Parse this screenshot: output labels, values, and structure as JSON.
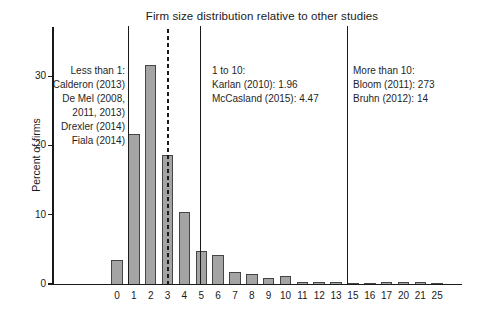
{
  "chart_data": {
    "type": "bar",
    "title": "Firm size distribution relative to other studies",
    "xlabel": "",
    "ylabel": "Percent of firms",
    "categories": [
      "0",
      "1",
      "2",
      "3",
      "4",
      "5",
      "6",
      "7",
      "8",
      "9",
      "10",
      "11",
      "12",
      "13",
      "15",
      "16",
      "17",
      "20",
      "21",
      "25"
    ],
    "values": [
      3.5,
      21.7,
      31.6,
      18.6,
      10.4,
      4.7,
      4.2,
      1.8,
      1.5,
      0.8,
      1.2,
      0.35,
      0.25,
      0.3,
      0.2,
      0.2,
      0.25,
      0.3,
      0.25,
      0.2
    ],
    "ylim": [
      0,
      36
    ],
    "yticks": [
      0,
      10,
      20,
      30
    ],
    "grid": false,
    "legend": null,
    "bar_fill_color": "#a4a4a4",
    "bar_border_color": "#454545",
    "reference_lines": [
      {
        "id": "sep-less-than-1",
        "style": "solid",
        "x_index": 0.68
      },
      {
        "id": "mean-firm-size",
        "style": "dashed",
        "x_index": 3.0
      },
      {
        "id": "sep-1-to-10",
        "style": "solid",
        "x_index": 4.95
      },
      {
        "id": "sep-more-than-10",
        "style": "solid",
        "x_index": 13.68
      }
    ],
    "annotations": [
      {
        "id": "less-than-1",
        "align": "right",
        "lines": [
          "Less than 1:",
          "Calderon (2013)",
          "De Mel (2008,",
          "2011, 2013)",
          "Drexler (2014)",
          "Fiala (2014)"
        ]
      },
      {
        "id": "1-to-10",
        "align": "left",
        "lines": [
          "1 to 10:",
          "Karlan (2010): 1.96",
          "McCasland (2015): 4.47"
        ]
      },
      {
        "id": "more-than-10",
        "align": "left",
        "lines": [
          "More than 10:",
          "Bloom (2011): 273",
          "Bruhn (2012): 14"
        ]
      }
    ]
  }
}
